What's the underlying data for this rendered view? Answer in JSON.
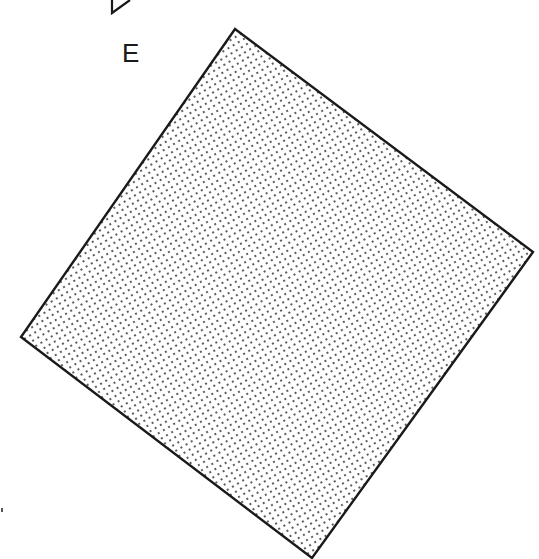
{
  "figure": {
    "label": "E",
    "shape": "tilted-square",
    "fill_pattern": "dot-stipple",
    "stroke_color": "#1a1a1a",
    "fill_dot_color": "#333333",
    "background": "#ffffff"
  }
}
